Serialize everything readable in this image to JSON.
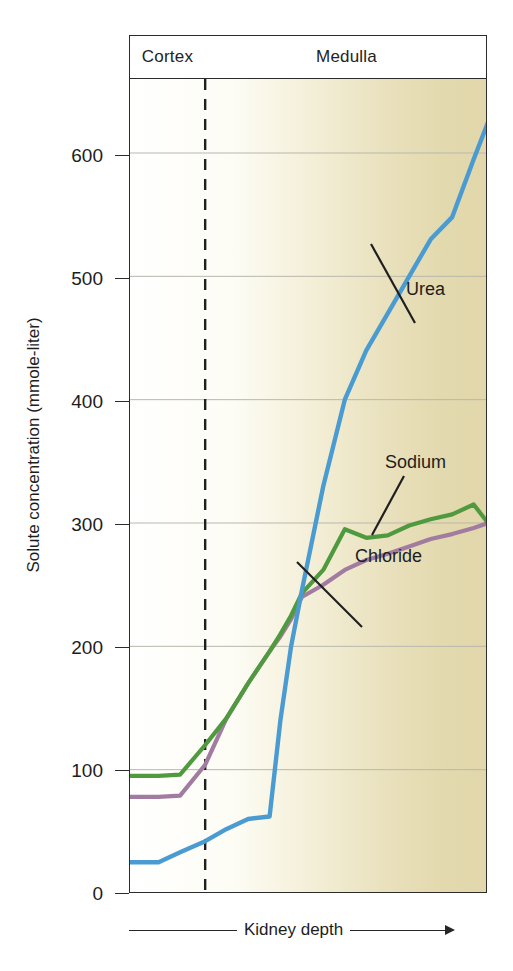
{
  "regions": {
    "cortex_label": "Cortex",
    "medulla_label": "Medulla"
  },
  "axes": {
    "y_title": "Solute concentration (mmole-liter)",
    "x_title": "Kidney depth",
    "y_ticks": [
      "0",
      "100",
      "200",
      "300",
      "400",
      "500",
      "600"
    ]
  },
  "series_labels": {
    "urea": "Urea",
    "sodium": "Sodium",
    "chloride": "Chloride"
  },
  "colors": {
    "urea": "#4a9bd1",
    "sodium": "#4f9a3f",
    "chloride": "#a27ca0",
    "axis": "#2b2b2b",
    "grid": "#b9b7ad",
    "plot_start": "#ffffff",
    "plot_end": "#e1d7ab",
    "leader": "#1f1f1f"
  },
  "chart_data": {
    "type": "line",
    "title": "",
    "xlabel": "Kidney depth",
    "ylabel": "Solute concentration (mmole-liter)",
    "ylim": [
      0,
      660
    ],
    "xlim": [
      0,
      100
    ],
    "grid": true,
    "legend_position": "inline-annotations",
    "yticks": [
      0,
      100,
      200,
      300,
      400,
      500,
      600
    ],
    "annotations": [
      {
        "text": "Cortex",
        "region_x": [
          0,
          21
        ]
      },
      {
        "text": "Medulla",
        "region_x": [
          21,
          100
        ]
      },
      {
        "text": "Urea",
        "points_to_series": "Urea"
      },
      {
        "text": "Sodium",
        "points_to_series": "Sodium"
      },
      {
        "text": "Chloride",
        "points_to_series": "Chloride"
      }
    ],
    "region_divider_x": 21,
    "x": [
      0,
      8,
      14,
      21,
      27,
      33,
      39,
      42,
      45,
      48,
      54,
      60,
      66,
      72,
      78,
      84,
      90,
      96,
      100
    ],
    "series": [
      {
        "name": "Urea",
        "color": "#4a9bd1",
        "values": [
          25,
          25,
          33,
          42,
          52,
          60,
          62,
          140,
          200,
          245,
          330,
          400,
          440,
          470,
          500,
          530,
          548,
          595,
          625
        ]
      },
      {
        "name": "Sodium",
        "color": "#4f9a3f",
        "values": [
          95,
          95,
          96,
          120,
          142,
          170,
          196,
          210,
          225,
          243,
          262,
          295,
          288,
          290,
          298,
          303,
          307,
          315,
          300
        ]
      },
      {
        "name": "Chloride",
        "color": "#a27ca0",
        "values": [
          78,
          78,
          79,
          104,
          142,
          170,
          196,
          208,
          222,
          240,
          250,
          262,
          270,
          275,
          281,
          287,
          291,
          296,
          300
        ]
      }
    ]
  }
}
